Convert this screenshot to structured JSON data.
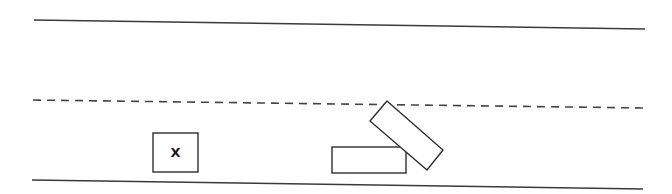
{
  "diagram": {
    "type": "traffic accident sketch",
    "background": "#ffffff",
    "road": {
      "top_edge": {
        "x1": 34,
        "y1": 20,
        "x2": 645,
        "y2": 29
      },
      "center_divider": {
        "x1": 33,
        "y1": 100,
        "x2": 645,
        "y2": 108,
        "style": "dashed"
      },
      "bottom_edge": {
        "x1": 32,
        "y1": 180,
        "x2": 643,
        "y2": 189
      }
    },
    "vehicles": [
      {
        "id": "vehicle-x",
        "label": "X",
        "shape": "rectangle",
        "x": 153,
        "y": 133,
        "width": 45,
        "height": 39,
        "rotation": 0
      },
      {
        "id": "vehicle-parked",
        "label": "",
        "shape": "rectangle",
        "x": 332,
        "y": 147,
        "width": 74,
        "height": 26,
        "rotation": 0
      },
      {
        "id": "vehicle-angled",
        "label": "",
        "shape": "polygon",
        "points": "387,101 443,150 427,170 370,121"
      }
    ]
  }
}
